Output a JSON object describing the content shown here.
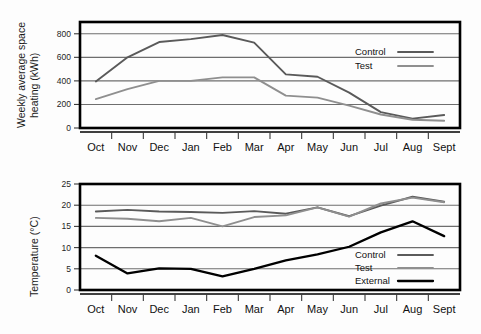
{
  "chart_data": [
    {
      "id": "space-heating",
      "type": "line",
      "title": "",
      "xlabel": "",
      "ylabel": "Weekly average space heating (kWh)",
      "ylabel_line1": "Weekly average space",
      "ylabel_line2": "heating (kWh)",
      "categories": [
        "Oct",
        "Nov",
        "Dec",
        "Jan",
        "Feb",
        "Mar",
        "Apr",
        "May",
        "Jun",
        "Jul",
        "Aug",
        "Sept"
      ],
      "yticks": [
        0,
        200,
        400,
        600,
        800
      ],
      "ylim": [
        0,
        900
      ],
      "grid": "horizontal",
      "legend_position": "inside-right",
      "series": [
        {
          "name": "Control",
          "color": "#5a5a5a",
          "values": [
            395,
            600,
            730,
            755,
            790,
            725,
            455,
            435,
            300,
            135,
            80,
            110
          ]
        },
        {
          "name": "Test",
          "color": "#8f8f8f",
          "values": [
            245,
            330,
            400,
            400,
            430,
            430,
            275,
            258,
            190,
            115,
            70,
            62
          ]
        }
      ]
    },
    {
      "id": "temperature",
      "type": "line",
      "title": "",
      "xlabel": "",
      "ylabel": "Temperature (°C)",
      "categories": [
        "Oct",
        "Nov",
        "Dec",
        "Jan",
        "Feb",
        "Mar",
        "Apr",
        "May",
        "Jun",
        "Jul",
        "Aug",
        "Sept"
      ],
      "yticks": [
        0,
        5,
        10,
        15,
        20,
        25
      ],
      "ylim": [
        0,
        25
      ],
      "grid": "horizontal",
      "legend_position": "inside-right",
      "series": [
        {
          "name": "Control",
          "color": "#5a5a5a",
          "values": [
            18.5,
            18.9,
            18.5,
            18.4,
            18.2,
            18.6,
            18.0,
            19.5,
            17.4,
            19.9,
            22.0,
            20.8
          ]
        },
        {
          "name": "Test",
          "color": "#8f8f8f",
          "values": [
            17.0,
            16.8,
            16.2,
            17.0,
            15.0,
            17.2,
            17.6,
            19.5,
            17.3,
            20.4,
            21.8,
            20.7
          ]
        },
        {
          "name": "External",
          "color": "#000000",
          "values": [
            8.1,
            3.9,
            5.1,
            5.0,
            3.2,
            5.0,
            7.0,
            8.4,
            10.2,
            13.6,
            16.2,
            12.7
          ]
        }
      ]
    }
  ],
  "axes": {
    "top": {
      "ytick_labels": [
        "0",
        "200",
        "400",
        "600",
        "800"
      ],
      "xtick_labels": [
        "Oct",
        "Nov",
        "Dec",
        "Jan",
        "Feb",
        "Mar",
        "Apr",
        "May",
        "Jun",
        "Jul",
        "Aug",
        "Sept"
      ]
    },
    "bottom": {
      "ytick_labels": [
        "0",
        "5",
        "10",
        "15",
        "20",
        "25"
      ],
      "xtick_labels": [
        "Oct",
        "Nov",
        "Dec",
        "Jan",
        "Feb",
        "Mar",
        "Apr",
        "May",
        "Jun",
        "Jul",
        "Aug",
        "Sept"
      ]
    }
  },
  "legends": {
    "top": [
      {
        "label": "Control",
        "color": "#5a5a5a"
      },
      {
        "label": "Test",
        "color": "#8f8f8f"
      }
    ],
    "bottom": [
      {
        "label": "Control",
        "color": "#5a5a5a"
      },
      {
        "label": "Test",
        "color": "#8f8f8f"
      },
      {
        "label": "External",
        "color": "#000000"
      }
    ]
  }
}
